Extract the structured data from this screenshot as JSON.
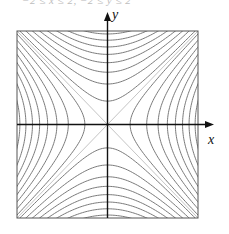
{
  "caption": "−2 ≤ x ≤ 2,  −2 ≤ y ≤ 2",
  "chart_data": {
    "type": "contour",
    "title": "",
    "function": "x^2 - y^2",
    "xlabel": "x",
    "ylabel": "y",
    "xlim": [
      -2,
      2
    ],
    "ylim": [
      -2,
      2
    ],
    "grid": false,
    "frame": true,
    "asymptotes": [
      "y = x",
      "y = -x"
    ],
    "levels_positive": [
      0.25,
      0.75,
      1.25,
      1.75,
      2.25,
      2.75,
      3.25,
      3.75
    ],
    "levels_negative": [
      -0.25,
      -0.75,
      -1.25,
      -1.75,
      -2.25,
      -2.75,
      -3.25,
      -3.75
    ],
    "colors": {
      "contour": "#7a7a7a",
      "asymptote": "#b5b5b5",
      "axis": "#111111",
      "frame": "#555555"
    }
  },
  "layout": {
    "box": {
      "left": 17,
      "top": 31,
      "right": 198,
      "bottom": 218
    },
    "origin": {
      "x": 107.5,
      "y": 124.5
    },
    "x_axis_arrow_end": 214,
    "y_axis_arrow_end": 12
  },
  "labels": {
    "x": "x",
    "y": "y"
  }
}
